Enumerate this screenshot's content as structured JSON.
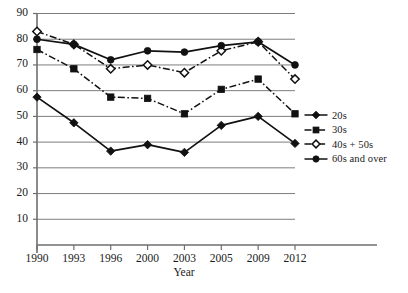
{
  "chart_data": {
    "type": "line",
    "title": "",
    "xlabel": "Year",
    "ylabel": "",
    "categories": [
      "1990",
      "1993",
      "1996",
      "2000",
      "2003",
      "2005",
      "2009",
      "2012"
    ],
    "x": [
      1990,
      1993,
      1996,
      2000,
      2003,
      2005,
      2009,
      2012
    ],
    "ylim": [
      0,
      90
    ],
    "yticks": [
      10,
      20,
      30,
      40,
      50,
      60,
      70,
      80,
      90
    ],
    "ytick_labels": [
      "10",
      "20",
      "30",
      "40",
      "50",
      "60",
      "70",
      "80",
      "90"
    ],
    "grid": true,
    "grid_axis": "y",
    "legend_position": "right",
    "series": [
      {
        "name": "20s",
        "marker": "filled-diamond",
        "line": "solid",
        "color": "#111111",
        "values": [
          57.5,
          47.5,
          36.5,
          39.0,
          36.0,
          46.5,
          50.0,
          39.5
        ]
      },
      {
        "name": "30s",
        "marker": "filled-square",
        "line": "dash-dot",
        "color": "#111111",
        "values": [
          76.0,
          68.5,
          57.5,
          57.0,
          51.0,
          60.5,
          64.5,
          51.0
        ]
      },
      {
        "name": "40s + 50s",
        "marker": "open-diamond",
        "line": "dash-dot",
        "color": "#111111",
        "values": [
          83.0,
          78.0,
          68.5,
          70.0,
          67.0,
          75.5,
          79.0,
          64.5
        ]
      },
      {
        "name": "60s and over",
        "marker": "filled-circle",
        "line": "solid",
        "color": "#111111",
        "values": [
          80.0,
          78.0,
          72.0,
          75.5,
          75.0,
          77.5,
          79.0,
          70.0
        ]
      }
    ]
  },
  "legend": {
    "items": [
      {
        "label": "20s"
      },
      {
        "label": "30s"
      },
      {
        "label": "40s + 50s"
      },
      {
        "label": "60s and over"
      }
    ]
  },
  "axes": {
    "x_title": "Year"
  }
}
